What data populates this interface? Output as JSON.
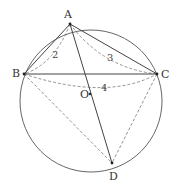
{
  "diagram": {
    "circle": {
      "cx": 91,
      "cy": 101,
      "r": 71,
      "stroke": "#555555"
    },
    "points": {
      "A": {
        "label": "A",
        "x": 70,
        "y": 24,
        "lx": 64,
        "ly": 18
      },
      "B": {
        "label": "B",
        "x": 24,
        "y": 74,
        "lx": 12,
        "ly": 77
      },
      "C": {
        "label": "C",
        "x": 157,
        "y": 74,
        "lx": 161,
        "ly": 78
      },
      "D": {
        "label": "D",
        "x": 112,
        "y": 163,
        "lx": 109,
        "ly": 180
      },
      "O": {
        "label": "O",
        "x": 90,
        "y": 94,
        "lx": 80,
        "ly": 98
      }
    },
    "solid_segments": [
      [
        "A",
        "B"
      ],
      [
        "A",
        "C"
      ],
      [
        "B",
        "C"
      ],
      [
        "A",
        "D"
      ]
    ],
    "dashed_segments": [
      [
        "B",
        "D"
      ],
      [
        "C",
        "D"
      ]
    ],
    "dashed_arcs": [
      {
        "from": "A",
        "to": "B",
        "label": "2",
        "lx": 52,
        "ly": 58
      },
      {
        "from": "A",
        "to": "C",
        "label": "3",
        "lx": 107,
        "ly": 61
      },
      {
        "from": "B",
        "to": "C",
        "label": "4",
        "lx": 101,
        "ly": 91
      }
    ],
    "line_color": "#444444",
    "dash_color": "#777777"
  }
}
